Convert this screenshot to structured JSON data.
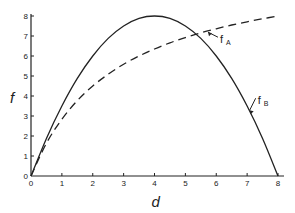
{
  "chart_data": {
    "type": "line",
    "title": "",
    "xlabel": "d",
    "ylabel": "f",
    "xlim": [
      0,
      8
    ],
    "ylim": [
      0,
      8
    ],
    "x_ticks": [
      "0",
      "1",
      "2",
      "3",
      "4",
      "5",
      "6",
      "7",
      "8"
    ],
    "y_ticks": [
      "0",
      "1",
      "2",
      "3",
      "4",
      "5",
      "6",
      "7",
      "8"
    ],
    "grid": false,
    "series": [
      {
        "name": "fA",
        "label_main": "f",
        "label_sub": "A",
        "style": "dashed",
        "x": [
          0,
          0.5,
          1,
          1.5,
          2,
          2.5,
          3,
          3.5,
          4,
          4.5,
          5,
          5.5,
          6,
          6.5,
          7,
          7.5,
          8
        ],
        "values": [
          0,
          1.64,
          2.84,
          3.77,
          4.5,
          5.09,
          5.59,
          6.0,
          6.35,
          6.66,
          6.92,
          7.16,
          7.36,
          7.55,
          7.71,
          7.86,
          8.0
        ]
      },
      {
        "name": "fB",
        "label_main": "f",
        "label_sub": "B",
        "style": "solid",
        "x": [
          0,
          0.5,
          1,
          1.5,
          2,
          2.5,
          3,
          3.5,
          4,
          4.5,
          5,
          5.5,
          6,
          6.5,
          7,
          7.5,
          8
        ],
        "values": [
          0,
          1.88,
          3.5,
          4.88,
          6.0,
          6.88,
          7.5,
          7.88,
          8.0,
          7.88,
          7.5,
          6.88,
          6.0,
          4.88,
          3.5,
          1.88,
          0
        ]
      }
    ],
    "annotations": [
      {
        "series": "fA",
        "text": "fA",
        "points_to_x": 5.7
      },
      {
        "series": "fB",
        "text": "fB",
        "points_to_x": 7.05
      }
    ]
  }
}
